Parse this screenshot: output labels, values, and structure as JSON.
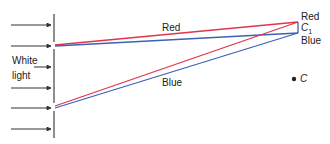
{
  "diagram": {
    "incident_label_line1": "White",
    "incident_label_line2": "light",
    "upper_path_label": "Red",
    "lower_path_label": "Blue",
    "screen_top_label": "Red",
    "screen_mid_label": "C",
    "screen_mid_sub": "1",
    "screen_bottom_label": "Blue",
    "center_point_label": "C",
    "colors": {
      "red_ray": "#e0354a",
      "blue_ray": "#3c62b4",
      "barrier": "#444444",
      "arrows": "#333333"
    },
    "arrow_count": 6
  }
}
